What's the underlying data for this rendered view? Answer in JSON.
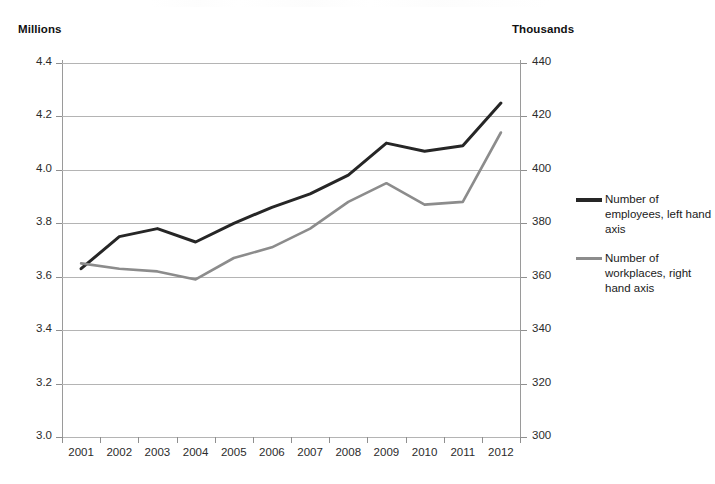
{
  "axes": {
    "left_unit": "Millions",
    "right_unit": "Thousands",
    "left_ticks": [
      "4.4",
      "4.2",
      "4.0",
      "3.8",
      "3.6",
      "3.4",
      "3.2",
      "3.0"
    ],
    "right_ticks": [
      "440",
      "420",
      "400",
      "380",
      "360",
      "340",
      "320",
      "300"
    ]
  },
  "legend": {
    "items": [
      {
        "label": "Number of employees, left hand axis",
        "color": "#262626"
      },
      {
        "label": "Number of workplaces, right hand axis",
        "color": "#8c8c8c"
      }
    ]
  },
  "chart_data": {
    "type": "line",
    "title": "",
    "xlabel": "",
    "ylabel": "Millions",
    "y2label": "Thousands",
    "grid": true,
    "legend_position": "right",
    "categories": [
      "2001",
      "2002",
      "2003",
      "2004",
      "2005",
      "2006",
      "2007",
      "2008",
      "2009",
      "2010",
      "2011",
      "2012"
    ],
    "ylim": [
      3.0,
      4.4
    ],
    "y2lim": [
      300,
      440
    ],
    "ytick_step": 0.2,
    "y2tick_step": 20,
    "series": [
      {
        "name": "Number of employees, left hand axis",
        "axis": "left",
        "unit": "Millions",
        "color": "#262626",
        "values": [
          3.63,
          3.75,
          3.78,
          3.73,
          3.8,
          3.86,
          3.91,
          3.98,
          4.1,
          4.07,
          4.09,
          4.25
        ]
      },
      {
        "name": "Number of workplaces, right hand axis",
        "axis": "right",
        "unit": "Thousands",
        "color": "#8c8c8c",
        "values": [
          365,
          363,
          362,
          359,
          367,
          371,
          378,
          388,
          395,
          387,
          388,
          414
        ]
      }
    ]
  }
}
